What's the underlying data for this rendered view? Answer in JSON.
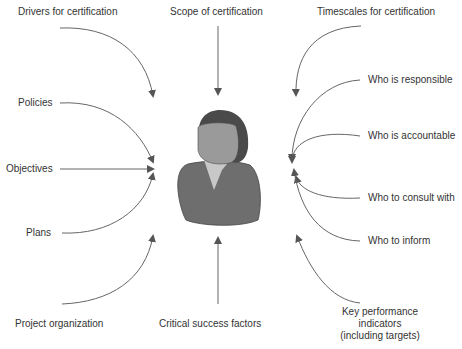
{
  "diagram": {
    "center": "person-icon",
    "left_labels": {
      "drivers": "Drivers for certification",
      "policies": "Policies",
      "objectives": "Objectives",
      "plans": "Plans",
      "project_org": "Project organization"
    },
    "top_label": "Scope of certification",
    "bottom_label": "Critical success factors",
    "right_labels": {
      "timescales": "Timescales for certification",
      "responsible": "Who is responsible",
      "accountable": "Who is accountable",
      "consult": "Who to consult with",
      "inform": "Who to inform",
      "kpi_line1": "Key performance",
      "kpi_line2": "indicators",
      "kpi_line3": "(including targets)"
    },
    "colors": {
      "arrow": "#555555",
      "hair": "#4a4a4a",
      "face": "#9a9a9a",
      "body": "#6e6e6e",
      "collar": "#c8c8c8"
    }
  }
}
